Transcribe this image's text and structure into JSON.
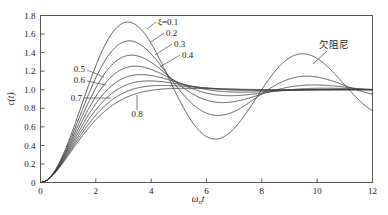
{
  "figure": {
    "background_color": "#ffffff",
    "curve_color": "#3a3a3a",
    "axis_color": "#5a5a5a"
  },
  "chart_data": {
    "type": "line",
    "title": "",
    "subtitle": "",
    "xlabel": "ωₙt",
    "xlabel_parts": {
      "main": "ω",
      "subscript": "n",
      "tail": "t"
    },
    "ylabel": "c(t)",
    "xlim": [
      0,
      12
    ],
    "ylim": [
      0,
      1.8
    ],
    "xticks": [
      0,
      2,
      4,
      6,
      8,
      10,
      12
    ],
    "xticklabels": [
      "0",
      "2",
      "4",
      "6",
      "8",
      "10",
      "12"
    ],
    "yticks": [
      0,
      0.2,
      0.4,
      0.6,
      0.8,
      1.0,
      1.2,
      1.4,
      1.6,
      1.8
    ],
    "yticklabels": [
      "0",
      "0.2",
      "0.4",
      "0.6",
      "0.8",
      "1.0",
      "1.2",
      "1.4",
      "1.6",
      "1.8"
    ],
    "grid": false,
    "legend_position": "inline-annotations",
    "series": [
      {
        "name": "ξ=0.1",
        "zeta": 0.1,
        "label": "ξ=0.1",
        "peak_value": 1.73,
        "peak_x": 3.16,
        "valley_value": 0.47,
        "valley_x": 6.31,
        "second_peak_value": 1.39,
        "second_peak_x": 9.47
      },
      {
        "name": "0.2",
        "zeta": 0.2,
        "label": "0.2",
        "peak_value": 1.53,
        "peak_x": 3.21,
        "valley_value": 0.73,
        "valley_x": 6.41,
        "second_peak_value": 1.15,
        "second_peak_x": 9.62
      },
      {
        "name": "0.3",
        "zeta": 0.3,
        "label": "0.3",
        "peak_value": 1.37,
        "peak_x": 3.29,
        "valley_value": 0.86,
        "valley_x": 6.59,
        "second_peak_value": 1.05,
        "second_peak_x": 9.88
      },
      {
        "name": "0.4",
        "zeta": 0.4,
        "label": "0.4",
        "peak_value": 1.25,
        "peak_x": 3.43,
        "valley_value": 0.92,
        "valley_x": 6.86,
        "second_peak_value": 1.02,
        "second_peak_x": 10.28
      },
      {
        "name": "0.5",
        "zeta": 0.5,
        "label": "0.5",
        "peak_value": 1.16,
        "peak_x": 3.63,
        "valley_value": 0.96,
        "valley_x": 7.26,
        "second_peak_value": 1.01,
        "second_peak_x": 10.88
      },
      {
        "name": "0.6",
        "zeta": 0.6,
        "label": "0.6",
        "peak_value": 1.09,
        "peak_x": 3.93,
        "valley_value": 0.98,
        "valley_x": 7.85,
        "second_peak_value": 1.0,
        "second_peak_x": 11.78
      },
      {
        "name": "0.7",
        "zeta": 0.7,
        "label": "0.7",
        "peak_value": 1.05,
        "peak_x": 4.4,
        "valley_value": 0.99,
        "valley_x": 8.8,
        "second_peak_value": 1.0,
        "second_peak_x": 13.2
      },
      {
        "name": "0.8",
        "zeta": 0.8,
        "label": "0.8",
        "peak_value": 1.02,
        "peak_x": 5.24,
        "valley_value": 1.0,
        "valley_x": 10.47,
        "second_peak_value": 1.0,
        "second_peak_x": 15.71
      }
    ],
    "annotations": [
      {
        "text": "ξ=0.1",
        "kind": "damping-label",
        "target_series": "0.1"
      },
      {
        "text": "0.2",
        "kind": "damping-label",
        "target_series": "0.2"
      },
      {
        "text": "0.3",
        "kind": "damping-label",
        "target_series": "0.3"
      },
      {
        "text": "0.4",
        "kind": "damping-label",
        "target_series": "0.4"
      },
      {
        "text": "0.5",
        "kind": "damping-label",
        "target_series": "0.5"
      },
      {
        "text": "0.6",
        "kind": "damping-label",
        "target_series": "0.6"
      },
      {
        "text": "0.7",
        "kind": "damping-label",
        "target_series": "0.7"
      },
      {
        "text": "0.8",
        "kind": "damping-label",
        "target_series": "0.8"
      },
      {
        "text": "欠阻尼",
        "kind": "region-label",
        "meaning": "underdamped"
      }
    ]
  },
  "labels": {
    "zeta_01": "ξ=0.1",
    "zeta_02": "0.2",
    "zeta_03": "0.3",
    "zeta_04": "0.4",
    "zeta_05": "0.5",
    "zeta_06": "0.6",
    "zeta_07": "0.7",
    "zeta_08": "0.8",
    "underdamped": "欠阻尼",
    "ylabel": "c(t)",
    "omega": "ω",
    "omega_sub": "n",
    "omega_tail": "t"
  }
}
